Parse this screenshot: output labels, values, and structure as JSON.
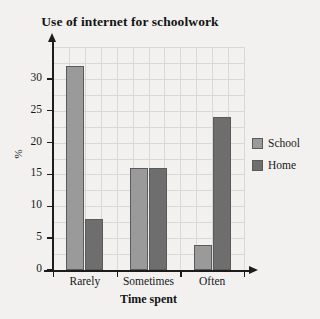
{
  "chart_data": {
    "type": "bar",
    "title": "Use of internet for schoolwork",
    "xlabel": "Time spent",
    "ylabel": "%",
    "categories": [
      "Rarely",
      "Sometimes",
      "Often"
    ],
    "series": [
      {
        "name": "School",
        "values": [
          32,
          16,
          4
        ],
        "color": "#9a9a9a"
      },
      {
        "name": "Home",
        "values": [
          8,
          16,
          24
        ],
        "color": "#6e6e6e"
      }
    ],
    "ylim": [
      0,
      35
    ],
    "yticks": [
      0,
      5,
      10,
      15,
      20,
      25,
      30
    ],
    "ytick_labels": [
      "0",
      "5",
      "10",
      "15",
      "20",
      "25",
      "30"
    ],
    "grid": true,
    "legend_position": "right"
  },
  "legend": {
    "entries": [
      {
        "label": "School",
        "color": "#9a9a9a"
      },
      {
        "label": "Home",
        "color": "#6e6e6e"
      }
    ]
  },
  "colors": {
    "background": "#f2f1ef",
    "axis": "#1c1c1c",
    "grid": "#d9d8d4",
    "bar_outline": "#5a5a5a",
    "school": "#9a9a9a",
    "home": "#6e6e6e"
  }
}
